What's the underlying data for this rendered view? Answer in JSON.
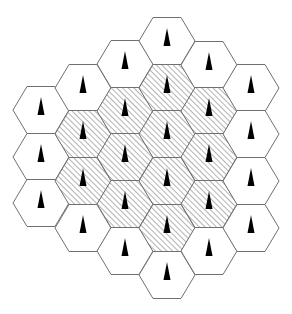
{
  "diagram": {
    "title": "",
    "type": "hexagonal-cellular-layout",
    "canvas": {
      "width": 292,
      "height": 314
    },
    "hex": {
      "radius": 28,
      "half_height": 23.5
    },
    "colors": {
      "outline": "#707070",
      "fill_plain": "#ffffff",
      "hatch_line": "#808080",
      "antenna": "#000000"
    },
    "hatch": {
      "spacing": 4,
      "direction": "diagonal-up-right"
    },
    "antenna": {
      "icon": "cell-tower-triangle-icon",
      "apex_offset": -13,
      "base_offset": 5,
      "half_width": 3.5
    },
    "columns": [
      {
        "x": 41,
        "cells": [
          {
            "y": 110,
            "hatched": false
          },
          {
            "y": 157,
            "hatched": false
          },
          {
            "y": 203,
            "hatched": false
          }
        ]
      },
      {
        "x": 83,
        "cells": [
          {
            "y": 88,
            "hatched": false
          },
          {
            "y": 134,
            "hatched": true
          },
          {
            "y": 181,
            "hatched": true
          },
          {
            "y": 228,
            "hatched": false
          }
        ]
      },
      {
        "x": 125,
        "cells": [
          {
            "y": 64,
            "hatched": false
          },
          {
            "y": 111,
            "hatched": true
          },
          {
            "y": 157,
            "hatched": true
          },
          {
            "y": 204,
            "hatched": true
          },
          {
            "y": 251,
            "hatched": false
          }
        ]
      },
      {
        "x": 167,
        "cells": [
          {
            "y": 41,
            "hatched": false
          },
          {
            "y": 88,
            "hatched": true
          },
          {
            "y": 134,
            "hatched": true
          },
          {
            "y": 181,
            "hatched": true
          },
          {
            "y": 228,
            "hatched": true
          },
          {
            "y": 275,
            "hatched": false
          }
        ]
      },
      {
        "x": 209,
        "cells": [
          {
            "y": 65,
            "hatched": false
          },
          {
            "y": 111,
            "hatched": true
          },
          {
            "y": 157,
            "hatched": true
          },
          {
            "y": 204,
            "hatched": true
          },
          {
            "y": 251,
            "hatched": false
          }
        ]
      },
      {
        "x": 251,
        "cells": [
          {
            "y": 88,
            "hatched": false
          },
          {
            "y": 134,
            "hatched": false
          },
          {
            "y": 181,
            "hatched": false
          },
          {
            "y": 228,
            "hatched": false
          }
        ]
      }
    ],
    "summary": {
      "total_cells": 27,
      "hatched_cells": 13,
      "plain_cells": 14
    }
  }
}
